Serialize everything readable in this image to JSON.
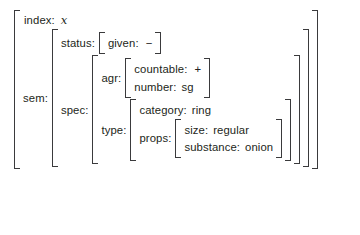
{
  "diagram": {
    "kind": "attribute-value-matrix",
    "bracket_color": "#3a3a3c",
    "text_color": "#231f20",
    "background": "#ffffff",
    "attributes": {
      "index": "index:",
      "sem": "sem:",
      "status": "status:",
      "given": "given:",
      "spec": "spec:",
      "agr": "agr:",
      "countable": "countable:",
      "number": "number:",
      "type": "type:",
      "category": "category:",
      "props": "props:",
      "size": "size:",
      "substance": "substance:"
    },
    "values": {
      "index": "x",
      "given": "−",
      "countable": "+",
      "number": "sg",
      "category": "ring",
      "size": "regular",
      "substance": "onion"
    }
  }
}
